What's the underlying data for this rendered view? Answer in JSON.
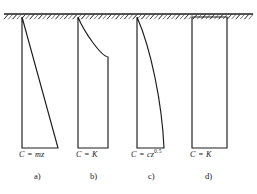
{
  "figure": {
    "background_color": "#ffffff",
    "line_color": "#1c1c1c",
    "ground": {
      "label": "ground-surface-line",
      "y": 14,
      "x_start": 4,
      "x_end": 253,
      "hatch_count": 58
    },
    "panels": [
      {
        "id": "a",
        "caption": "a)",
        "equation_text": "C = mz",
        "equation_base": "C = mz",
        "equation_exponent": "",
        "profile_type": "linear-triangular",
        "top_y": 17,
        "bottom_y": 148,
        "left_x": 22,
        "top_right_x": 22,
        "bottom_right_x": 58,
        "caption_x": 34,
        "label_x": 19,
        "label_y": 151
      },
      {
        "id": "b",
        "caption": "b)",
        "equation_text": "C = K",
        "equation_base": "C = K",
        "equation_exponent": "",
        "profile_type": "constant-with-transition-curve",
        "top_y": 17,
        "bottom_y": 148,
        "left_x": 78,
        "top_right_x": 78,
        "bottom_right_x": 108,
        "transition_y": 57,
        "caption_x": 90,
        "label_x": 76,
        "label_y": 151
      },
      {
        "id": "c",
        "caption": "c)",
        "equation_text": "C = cz0.5",
        "equation_base": "C = cz",
        "equation_exponent": "0.5",
        "profile_type": "square-root-curved",
        "top_y": 17,
        "bottom_y": 148,
        "left_x": 137,
        "top_right_x": 137,
        "bottom_right_x": 164,
        "caption_x": 148,
        "label_x": 131,
        "label_y": 151
      },
      {
        "id": "d",
        "caption": "d)",
        "equation_text": "C = K",
        "equation_base": "C = K",
        "equation_exponent": "",
        "profile_type": "uniform-rectangular",
        "top_y": 17,
        "bottom_y": 148,
        "left_x": 192,
        "top_right_x": 227,
        "bottom_right_x": 227,
        "caption_x": 205,
        "label_x": 190,
        "label_y": 151
      }
    ],
    "caption_y": 172
  }
}
